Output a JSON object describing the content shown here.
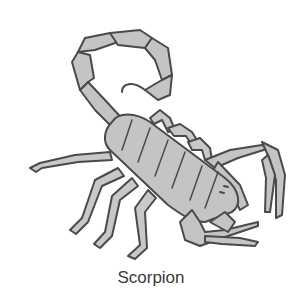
{
  "figure": {
    "caption": "Scorpion",
    "colors": {
      "fill": "#c4c4c4",
      "outline": "#4a4a4a",
      "background": "#ffffff"
    }
  }
}
